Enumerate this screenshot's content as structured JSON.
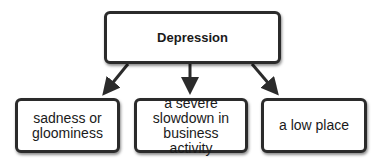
{
  "diagram": {
    "type": "concept-map",
    "root": {
      "label": "Depression"
    },
    "children": [
      {
        "label": "sadness or gloominess"
      },
      {
        "label": "a severe slowdown in business activity"
      },
      {
        "label": "a low place"
      }
    ],
    "colors": {
      "border": "#2b2b2b",
      "arrow": "#2b2b2b",
      "background": "#ffffff",
      "text": "#1a1a1a"
    }
  }
}
